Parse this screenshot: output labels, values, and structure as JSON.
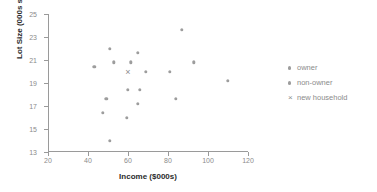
{
  "chart_data": {
    "type": "scatter",
    "title": "",
    "xlabel": "Income ($000s)",
    "ylabel": "Lot Size (000s sqft)",
    "xlim": [
      20,
      120
    ],
    "ylim": [
      13,
      25
    ],
    "xticks": [
      20,
      40,
      60,
      80,
      100,
      120
    ],
    "yticks": [
      13,
      15,
      17,
      19,
      21,
      23,
      25
    ],
    "grid": false,
    "legend_position": "right",
    "marker_color": "#9d9d9d",
    "axis_color": "#9a9a9a",
    "text_color": "#8b8b8b",
    "series": [
      {
        "name": "owner",
        "marker": "dot",
        "points": [
          {
            "x": 60,
            "y": 18.4
          },
          {
            "x": 85.5,
            "y": 16.8
          },
          {
            "x": 64.8,
            "y": 21.6
          },
          {
            "x": 61.5,
            "y": 20.8
          },
          {
            "x": 87,
            "y": 23.6
          },
          {
            "x": 110,
            "y": 19.2
          },
          {
            "x": 93,
            "y": 20.8
          },
          {
            "x": 81,
            "y": 20.0
          },
          {
            "x": 69,
            "y": 20.0
          },
          {
            "x": 66,
            "y": 18.4
          },
          {
            "x": 47,
            "y": 25.0
          }
        ]
      },
      {
        "name": "non-owner",
        "marker": "dot",
        "points": [
          {
            "x": 75,
            "y": 19.6
          },
          {
            "x": 52.8,
            "y": 20.8
          },
          {
            "x": 64.8,
            "y": 17.2
          },
          {
            "x": 43.2,
            "y": 20.4
          },
          {
            "x": 84,
            "y": 17.6
          },
          {
            "x": 49.2,
            "y": 17.6
          },
          {
            "x": 59.4,
            "y": 16.0
          },
          {
            "x": 66,
            "y": 18.4
          },
          {
            "x": 47.4,
            "y": 16.4
          },
          {
            "x": 33,
            "y": 18.8
          },
          {
            "x": 51,
            "y": 22.0
          },
          {
            "x": 51,
            "y": 14.0
          }
        ]
      },
      {
        "name": "new household",
        "marker": "cross",
        "points": [
          {
            "x": 60,
            "y": 20.0
          }
        ]
      }
    ],
    "plotted_points": [
      {
        "x": 43.2,
        "y": 20.4,
        "series": "non-owner"
      },
      {
        "x": 47.4,
        "y": 16.4,
        "series": "non-owner"
      },
      {
        "x": 49.2,
        "y": 17.6,
        "series": "non-owner"
      },
      {
        "x": 51.0,
        "y": 22.0,
        "series": "non-owner"
      },
      {
        "x": 51.0,
        "y": 14.0,
        "series": "non-owner"
      },
      {
        "x": 52.8,
        "y": 20.8,
        "series": "non-owner"
      },
      {
        "x": 59.4,
        "y": 16.0,
        "series": "non-owner"
      },
      {
        "x": 60.0,
        "y": 18.4,
        "series": "owner"
      },
      {
        "x": 61.5,
        "y": 20.8,
        "series": "owner"
      },
      {
        "x": 64.8,
        "y": 21.6,
        "series": "owner"
      },
      {
        "x": 64.8,
        "y": 17.2,
        "series": "non-owner"
      },
      {
        "x": 66.0,
        "y": 18.4,
        "series": "owner"
      },
      {
        "x": 69.0,
        "y": 20.0,
        "series": "owner"
      },
      {
        "x": 81.0,
        "y": 20.0,
        "series": "owner"
      },
      {
        "x": 84.0,
        "y": 17.6,
        "series": "non-owner"
      },
      {
        "x": 87.0,
        "y": 23.6,
        "series": "owner"
      },
      {
        "x": 93.0,
        "y": 20.8,
        "series": "owner"
      },
      {
        "x": 110.0,
        "y": 19.2,
        "series": "owner"
      },
      {
        "x": 60.0,
        "y": 20.0,
        "series": "new household"
      }
    ]
  },
  "legend": {
    "items": [
      {
        "label": "owner",
        "marker": "dot"
      },
      {
        "label": "non-owner",
        "marker": "dot"
      },
      {
        "label": "new household",
        "marker": "×"
      }
    ]
  },
  "axes": {
    "x_tick_labels": [
      "20",
      "40",
      "60",
      "80",
      "100",
      "120"
    ],
    "y_tick_labels": [
      "13",
      "15",
      "17",
      "19",
      "21",
      "23",
      "25"
    ],
    "x_title": "Income ($000s)",
    "y_title": "Lot Size (000s sqft)"
  }
}
